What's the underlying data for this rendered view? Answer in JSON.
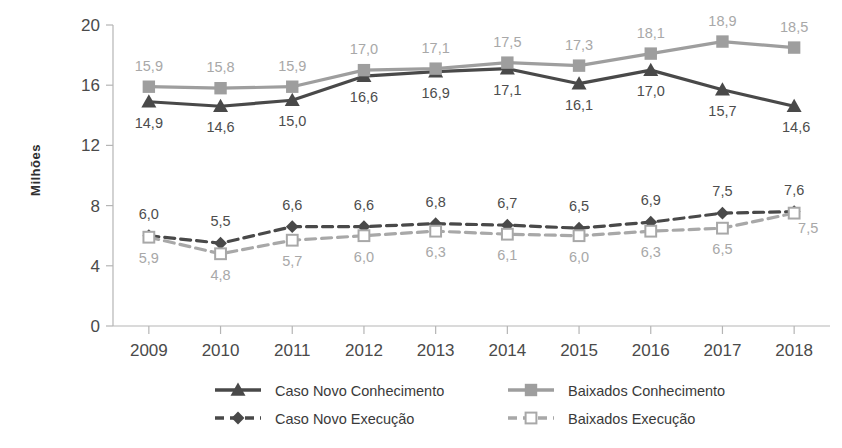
{
  "chart_data": {
    "type": "line",
    "title": "",
    "xlabel": "",
    "ylabel": "Milhões",
    "categories": [
      "2009",
      "2010",
      "2011",
      "2012",
      "2013",
      "2014",
      "2015",
      "2016",
      "2017",
      "2018"
    ],
    "ylim": [
      0,
      20
    ],
    "y_ticks": [
      "0",
      "4",
      "8",
      "12",
      "16",
      "20"
    ],
    "grid": false,
    "legend_position": "bottom",
    "series": [
      {
        "name": "Caso Novo Conhecimento",
        "style": "solid",
        "marker": "triangle",
        "color": "#494949",
        "values": [
          14.9,
          14.6,
          15.0,
          16.6,
          16.9,
          17.1,
          16.1,
          17.0,
          15.7,
          14.6
        ],
        "labels": [
          "14,9",
          "14,6",
          "15,0",
          "16,6",
          "16,9",
          "17,1",
          "16,1",
          "17,0",
          "15,7",
          "14,6"
        ]
      },
      {
        "name": "Baixados Conhecimento",
        "style": "solid",
        "marker": "square",
        "color": "#9e9e9e",
        "values": [
          15.9,
          15.8,
          15.9,
          17.0,
          17.1,
          17.5,
          17.3,
          18.1,
          18.9,
          18.5
        ],
        "labels": [
          "15,9",
          "15,8",
          "15,9",
          "17,0",
          "17,1",
          "17,5",
          "17,3",
          "18,1",
          "18,9",
          "18,5"
        ]
      },
      {
        "name": "Caso Novo Execução",
        "style": "dashed",
        "marker": "diamond",
        "color": "#494949",
        "values": [
          6.0,
          5.5,
          6.6,
          6.6,
          6.8,
          6.7,
          6.5,
          6.9,
          7.5,
          7.6
        ],
        "labels": [
          "6,0",
          "5,5",
          "6,6",
          "6,6",
          "6,8",
          "6,7",
          "6,5",
          "6,9",
          "7,5",
          "7,6"
        ]
      },
      {
        "name": "Baixados Execução",
        "style": "dashed",
        "marker": "square-open",
        "color": "#a8a8a8",
        "values": [
          5.9,
          4.8,
          5.7,
          6.0,
          6.3,
          6.1,
          6.0,
          6.3,
          6.5,
          7.5
        ],
        "labels": [
          "5,9",
          "4,8",
          "5,7",
          "6,0",
          "6,3",
          "6,1",
          "6,0",
          "6,3",
          "6,5",
          "7,5"
        ]
      }
    ],
    "legend": [
      {
        "label": "Caso Novo Conhecimento",
        "marker": "triangle",
        "style": "solid",
        "color": "#494949"
      },
      {
        "label": "Baixados Conhecimento",
        "marker": "square",
        "style": "solid",
        "color": "#9e9e9e"
      },
      {
        "label": "Caso Novo Execução",
        "marker": "diamond",
        "style": "dashed",
        "color": "#494949"
      },
      {
        "label": "Baixados Execução",
        "marker": "square-open",
        "style": "dashed",
        "color": "#a8a8a8"
      }
    ]
  },
  "colors": {
    "dark_series": "#494949",
    "light_series": "#9e9e9e",
    "axis": "#b0b0b0",
    "background": "#ffffff"
  }
}
